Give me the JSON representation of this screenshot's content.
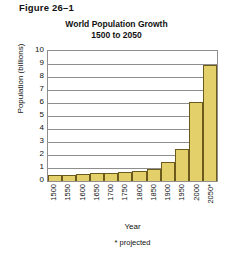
{
  "figure": {
    "label": "Figure 26–1"
  },
  "chart_data": {
    "type": "bar",
    "title": "World Population Growth",
    "subtitle": "1500 to 2050",
    "xlabel": "Year",
    "ylabel": "Population (billions)",
    "categories": [
      "1500",
      "1550",
      "1600",
      "1650",
      "1700",
      "1750",
      "1800",
      "1850",
      "1900",
      "1950",
      "2000",
      "2050*"
    ],
    "values": [
      0.45,
      0.5,
      0.55,
      0.6,
      0.65,
      0.7,
      0.8,
      0.9,
      1.45,
      2.5,
      6.1,
      8.9
    ],
    "ylim": [
      0,
      10
    ],
    "ytick_labels": [
      "0",
      "1",
      "2",
      "3",
      "4",
      "5",
      "6",
      "7",
      "8",
      "9",
      "10"
    ],
    "grid": true,
    "legend": "none",
    "bar_color": "#e3d06a",
    "bar_border_color": "#6b5a1c",
    "axis_color": "#8e8e8e",
    "footnote": "* projected"
  }
}
